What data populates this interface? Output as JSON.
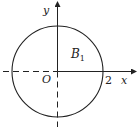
{
  "diagram": {
    "axes": {
      "x_label": "x",
      "y_label": "y",
      "origin_label": "O",
      "x_tick_label": "2"
    },
    "region": {
      "label_main": "B",
      "label_sub": "1"
    },
    "circle": {
      "center": [
        0,
        0
      ],
      "radius": 2
    },
    "colors": {
      "stroke": "#222222",
      "background": "#ffffff"
    }
  }
}
